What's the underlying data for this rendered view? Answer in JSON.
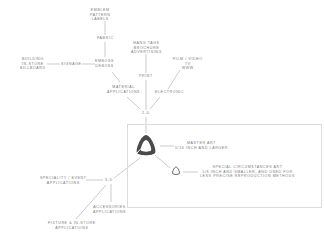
{
  "diagram": {
    "nodes": {
      "emblem": "EMBLEM\nPATTERN\nLABELS",
      "fabric": "FABRIC",
      "building": "BUILDING\nIN-STORE\nBILLBOARD",
      "signage": "SIGNAGE",
      "emboss": "EMBOSS\nDEBOSS",
      "hang_tags": "HANG TAGS\nBROCHURE\nADVERTISING",
      "print": "PRINT",
      "film": "FILM / VIDEO\nTV\nWWW",
      "material": "MATERIAL\nAPPLICATIONS",
      "electronic": "ELECTRONIC",
      "two_d": "2-D",
      "master_art": "MASTER ART\n5/16 INCH AND LARGER",
      "special_art": "SPECIAL CIRCUMSTANCES ART\n1/8 INCH AND SMALLER, AND USED FOR\nLESS PRECISE REPRODUCTION METHODS",
      "speciality": "SPECIALITY / EVENT\nAPPLICATIONS",
      "three_d": "3-D",
      "accessories": "ACCESSORIES\nAPPLICATIONS",
      "fixture": "FIXTURE & IN-STORE\nAPPLICATIONS"
    },
    "colors": {
      "line": "#9a9a9a",
      "text": "#7a7a7a",
      "box_border": "#dcdcdc",
      "logo": "#555555"
    }
  }
}
